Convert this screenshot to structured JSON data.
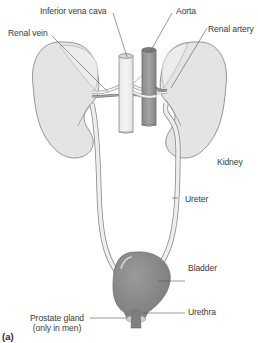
{
  "figure": {
    "caption": "(a)"
  },
  "labels": {
    "inferior_vena_cava": "Inferior vena cava",
    "aorta": "Aorta",
    "renal_vein": "Renal vein",
    "renal_artery": "Renal artery",
    "kidney": "Kidney",
    "ureter": "Ureter",
    "bladder": "Bladder",
    "urethra": "Urethra",
    "prostate_gland_line1": "Prostate gland",
    "prostate_gland_line2": "(only in men)"
  },
  "colors": {
    "kidney_fill": "#e4e4e4",
    "kidney_stroke": "#8a8a8a",
    "vena_cava_fill": "#f0f0f0",
    "aorta_fill": "#9a9a9a",
    "bladder_fill": "#8c8c8c",
    "ureter_fill": "#eeeeee",
    "prostate_fill": "#cfcfcf",
    "leader_line": "#555555",
    "text": "#3a3a3a"
  }
}
